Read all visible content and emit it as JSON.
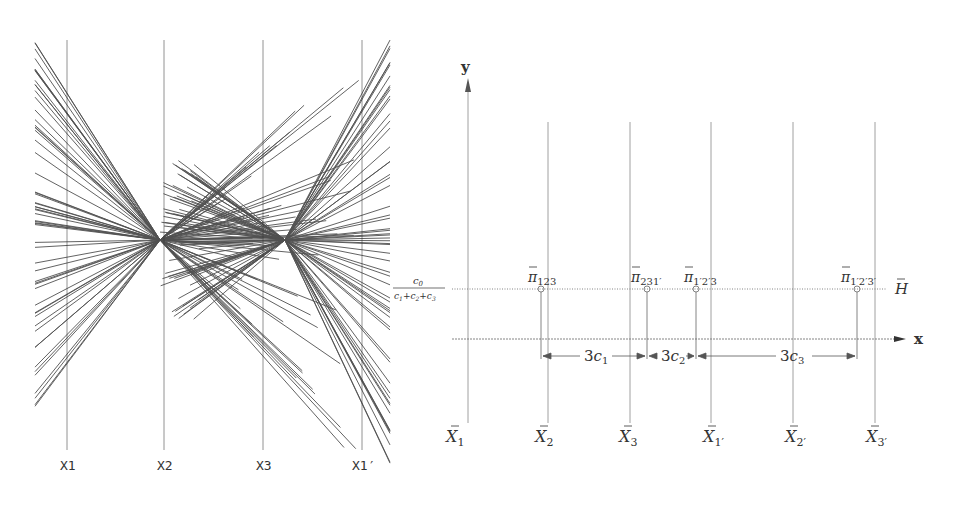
{
  "left_panel": {
    "axis_labels": [
      "X1",
      "X2",
      "X3",
      "X1′"
    ],
    "axis_x": [
      67,
      164,
      263,
      362
    ],
    "intersection_points": [
      {
        "x": 160,
        "y": 240
      },
      {
        "x": 285,
        "y": 240
      }
    ],
    "side_label": {
      "numerator": "c0",
      "denominator": "c1+c2+c3"
    }
  },
  "right_panel": {
    "y_label": "y",
    "x_label": "x",
    "h_label": "H̄",
    "axes": [
      {
        "base": "X̄",
        "sub": "1",
        "x": 468
      },
      {
        "base": "X̄",
        "sub": "2",
        "x": 548
      },
      {
        "base": "X̄",
        "sub": "3",
        "x": 630
      },
      {
        "base": "X̄",
        "sub": "1′",
        "x": 711
      },
      {
        "base": "X̄",
        "sub": "2′",
        "x": 793
      },
      {
        "base": "X̄",
        "sub": "3′",
        "x": 875
      }
    ],
    "points": [
      {
        "base": "π̄",
        "sub": "123",
        "x": 541
      },
      {
        "base": "π̄",
        "sub": "231′",
        "x": 647
      },
      {
        "base": "π̄",
        "sub": "1′2′3",
        "x": 696
      },
      {
        "base": "π̄",
        "sub": "1′2′3′",
        "x": 857
      }
    ],
    "spacing_labels": [
      "3c₁",
      "3c₂",
      "3c₃"
    ]
  }
}
